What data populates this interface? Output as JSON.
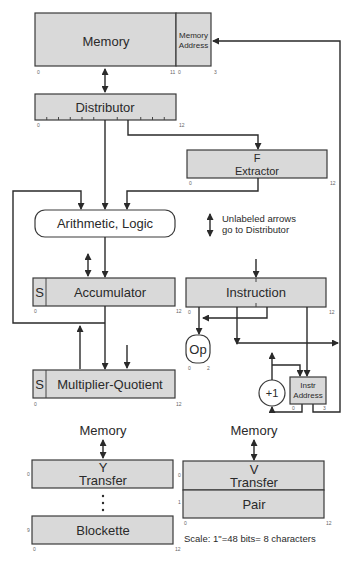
{
  "registers": {
    "memory": {
      "label": "Memory",
      "start": "0",
      "end": "11"
    },
    "memory_address": {
      "label_line1": "Memory",
      "label_line2": "Address",
      "start": "0",
      "end": "3"
    },
    "distributor": {
      "label": "Distributor",
      "start": "0",
      "end": "12"
    },
    "f_extractor": {
      "label_line1": "F",
      "label_line2": "Extractor",
      "start": "0",
      "end": "12"
    },
    "arithmetic_logic": {
      "label": "Arithmetic, Logic"
    },
    "accumulator": {
      "sign": "S",
      "label": "Accumulator",
      "start": "0",
      "end": "12"
    },
    "multiplier_quotient": {
      "sign": "S",
      "label": "Multiplier-Quotient",
      "start": "0",
      "end": "12"
    },
    "instruction": {
      "label": "Instruction",
      "start": "0",
      "end": "12"
    },
    "op": {
      "label": "Op",
      "start": "0",
      "end": "2"
    },
    "increment": {
      "label": "+1"
    },
    "instr_address": {
      "label_line1": "Instr",
      "label_line2": "Address",
      "start": "0",
      "end": "3"
    },
    "y_transfer": {
      "top_label": "Memory",
      "label_line1": "Y",
      "label_line2": "Transfer",
      "row": "0"
    },
    "blockette": {
      "label": "Blockette",
      "row": "9",
      "start": "0",
      "end": "12"
    },
    "v_transfer": {
      "top_label": "Memory",
      "label_line1": "V",
      "label_line2": "Transfer",
      "row": "0"
    },
    "pair": {
      "label": "Pair",
      "row": "1",
      "start": "0",
      "end": "12"
    }
  },
  "legend": {
    "line1": "Unlabeled arrows",
    "line2": "go to Distributor"
  },
  "scale_note": "Scale:  1\"=48 bits= 8 characters",
  "ellipsis": "⋮"
}
